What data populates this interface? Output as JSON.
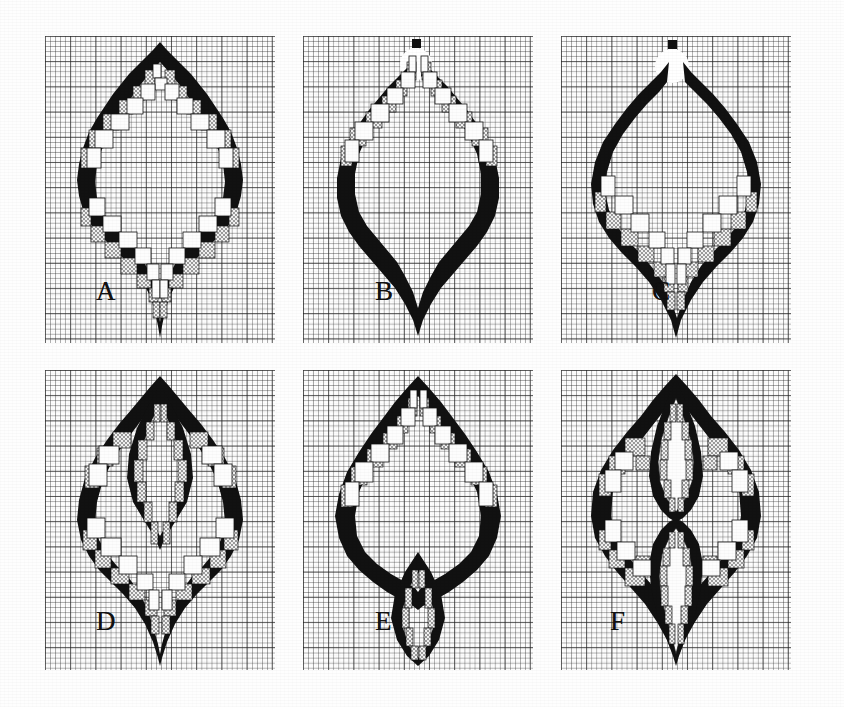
{
  "figure": {
    "caption": "",
    "background_color": "#fefefe",
    "ink_color": "#111111",
    "stipple_color": "#e9e9e9",
    "grid_color": "#282828",
    "rows": 2,
    "columns": 3,
    "width": 844,
    "height": 707
  },
  "legend": {
    "fill_black": "solid black border cells",
    "fill_stipple": "stippled / dotted cells",
    "fill_white": "thin-outlined white cells"
  },
  "panels": [
    {
      "id": "A",
      "label": "A",
      "label_x": 96,
      "label_y": 278,
      "grid": {
        "x": 45,
        "y": 36,
        "w": 230,
        "h": 307
      },
      "lobes_top": 1,
      "lobes_bottom": 1,
      "has_detached_dot": false,
      "has_white_notch": false,
      "description": "single onion outline, stippled staircase bands along upper and lower inner contours, cusp at bottom"
    },
    {
      "id": "B",
      "label": "B",
      "label_x": 375,
      "label_y": 278,
      "grid": {
        "x": 303,
        "y": 36,
        "w": 230,
        "h": 307
      },
      "lobes_top": 1,
      "lobes_bottom": 1,
      "has_detached_dot": true,
      "has_white_notch": true,
      "description": "onion outline with detached black dot above apex and white notch; stippled band only along upper inner contour"
    },
    {
      "id": "C",
      "label": "C",
      "label_x": 652,
      "label_y": 278,
      "grid": {
        "x": 561,
        "y": 36,
        "w": 230,
        "h": 307
      },
      "lobes_top": 1,
      "lobes_bottom": 1,
      "has_detached_dot": true,
      "has_white_notch": true,
      "description": "onion outline with detached black dot above apex and white notch; stippled band only along lower inner contour"
    },
    {
      "id": "D",
      "label": "D",
      "label_x": 96,
      "label_y": 628,
      "grid": {
        "x": 45,
        "y": 370,
        "w": 230,
        "h": 300
      },
      "lobes_top": 1,
      "lobes_bottom": 1,
      "has_detached_dot": false,
      "has_white_notch": false,
      "description": "onion outline with an additional inner vertical diamond lobe in the upper half"
    },
    {
      "id": "E",
      "label": "E",
      "label_x": 375,
      "label_y": 628,
      "grid": {
        "x": 303,
        "y": 370,
        "w": 230,
        "h": 300
      },
      "lobes_top": 1,
      "lobes_bottom": 1,
      "has_detached_dot": false,
      "has_white_notch": false,
      "description": "onion outline with an isolated small inner diamond lobe in the lower half"
    },
    {
      "id": "F",
      "label": "F",
      "label_x": 610,
      "label_y": 628,
      "grid": {
        "x": 561,
        "y": 370,
        "w": 230,
        "h": 300
      },
      "lobes_top": 1,
      "lobes_bottom": 1,
      "has_detached_dot": false,
      "has_white_notch": false,
      "description": "onion outline split by a central vertical black spine into two inner diamond lobes, left and right round lobes stippled"
    }
  ]
}
